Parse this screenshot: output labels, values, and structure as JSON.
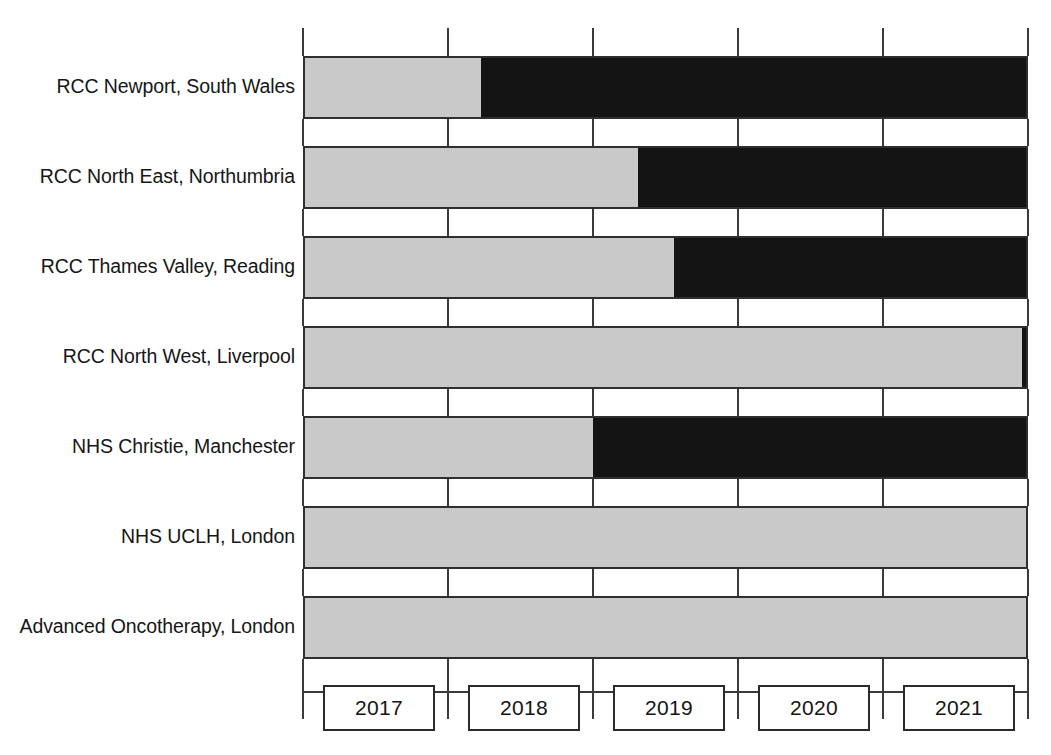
{
  "chart_data": {
    "type": "bar",
    "orientation": "horizontal",
    "stacked": true,
    "title": "",
    "subtitle": "",
    "xlabel": "",
    "ylabel": "",
    "grid": false,
    "legend_position": "none",
    "axis": {
      "tick_labels": [
        "2017",
        "2018",
        "2019",
        "2020",
        "2021"
      ],
      "tick_boundaries": [
        2016.5,
        2017.5,
        2018.5,
        2019.5,
        2020.5,
        2021.5
      ],
      "xlim": [
        2016.5,
        2021.5
      ]
    },
    "categories": [
      "RCC Newport, South Wales",
      "RCC North East, Northumbria",
      "RCC Thames Valley, Reading",
      "RCC North West, Liverpool",
      "NHS Christie, Manchester",
      "NHS UCLH, London",
      "Advanced Oncotherapy, London"
    ],
    "series": [
      {
        "name": "construction",
        "color": "#c9c9c9",
        "values": [
          1.23,
          2.31,
          2.56,
          4.96,
          2.0,
          5.0,
          5.0
        ]
      },
      {
        "name": "treatment",
        "color": "#141414",
        "values": [
          3.77,
          2.69,
          2.44,
          0.04,
          3.0,
          0.0,
          0.0
        ]
      }
    ],
    "bar_end": 2021.5
  },
  "legend": {
    "grey_label": "",
    "black_label": ""
  },
  "colors": {
    "grey": "#c9c9c9",
    "black": "#141414",
    "outline": "#2f2f2f",
    "background": "#ffffff",
    "text": "#161616"
  }
}
